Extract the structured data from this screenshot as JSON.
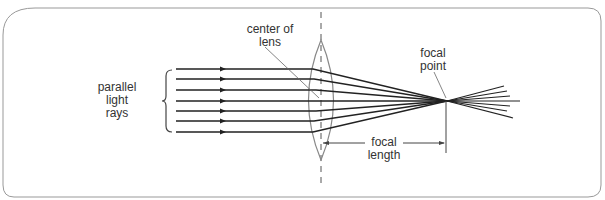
{
  "labels": {
    "parallel": "parallel",
    "light": "light",
    "rays": "rays",
    "center_line1": "center of",
    "center_line2": "lens",
    "focal_point_line1": "focal",
    "focal_point_line2": "point",
    "focal_length_line1": "focal",
    "focal_length_line2": "length"
  },
  "diagram": {
    "ray_count": 7,
    "colors": {
      "line": "#222222",
      "lens": "#888888",
      "frame": "#999999"
    }
  }
}
